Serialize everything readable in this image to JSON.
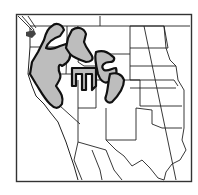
{
  "map": {
    "type": "species-range-map",
    "region": "Western United States",
    "colors": {
      "background": "#ffffff",
      "frame": "#333333",
      "state_lines": "#222222",
      "range_fill": "#bdbdbd",
      "range_outline": "#111111",
      "dark_patch": "#444444"
    },
    "legend": [],
    "labels": []
  }
}
